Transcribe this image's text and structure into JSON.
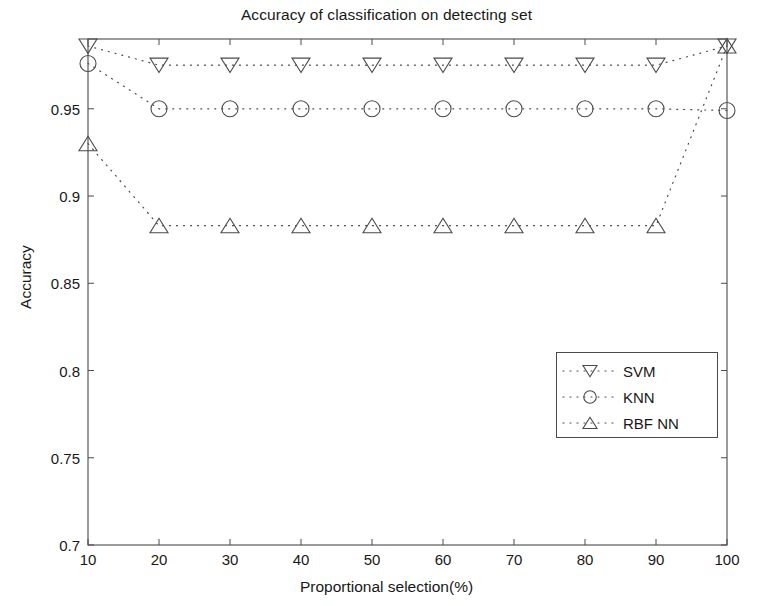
{
  "chart_data": {
    "type": "line",
    "title": "Accuracy of classification on detecting set",
    "xlabel": "Proportional selection(%)",
    "ylabel": "Accuracy",
    "x": [
      10,
      20,
      30,
      40,
      50,
      60,
      70,
      80,
      90,
      100
    ],
    "xlim": [
      10,
      100
    ],
    "ylim": [
      0.7,
      0.99
    ],
    "xticks": [
      10,
      20,
      30,
      40,
      50,
      60,
      70,
      80,
      90,
      100
    ],
    "xtick_labels": [
      "10",
      "20",
      "30",
      "40",
      "50",
      "60",
      "70",
      "80",
      "90",
      "100"
    ],
    "yticks": [
      0.7,
      0.75,
      0.8,
      0.85,
      0.9,
      0.95
    ],
    "ytick_labels": [
      "0.7",
      "0.75",
      "0.8",
      "0.85",
      "0.9",
      "0.95"
    ],
    "grid": false,
    "linestyle": "dotted",
    "legend_position": "center-right",
    "series": [
      {
        "name": "SVM",
        "marker": "triangle-down",
        "color": "#4a4a4a",
        "values": [
          0.986,
          0.975,
          0.975,
          0.975,
          0.975,
          0.975,
          0.975,
          0.975,
          0.975,
          0.986
        ]
      },
      {
        "name": "KNN",
        "marker": "circle",
        "color": "#4a4a4a",
        "values": [
          0.976,
          0.95,
          0.95,
          0.95,
          0.95,
          0.95,
          0.95,
          0.95,
          0.95,
          0.949
        ]
      },
      {
        "name": "RBF NN",
        "marker": "triangle-up",
        "color": "#4a4a4a",
        "values": [
          0.93,
          0.883,
          0.883,
          0.883,
          0.883,
          0.883,
          0.883,
          0.883,
          0.883,
          0.986
        ]
      }
    ]
  },
  "legend": {
    "items": [
      {
        "label": "SVM",
        "marker": "triangle-down-icon"
      },
      {
        "label": "KNN",
        "marker": "circle-icon"
      },
      {
        "label": "RBF NN",
        "marker": "triangle-up-icon"
      }
    ]
  }
}
